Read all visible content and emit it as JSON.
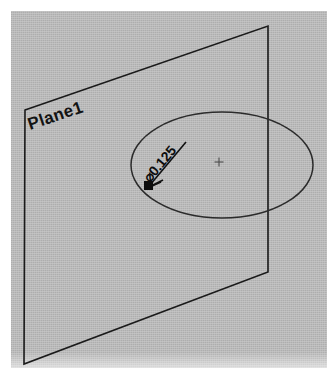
{
  "viewport": {
    "name": "cad-isometric-viewport",
    "background_color": "#b4b4b4",
    "page_color": "#ffffff"
  },
  "drawing": {
    "title": "",
    "type": "isometric-cad-sketch",
    "line_color": "#1a1a1a",
    "entities": {
      "plane": {
        "label": "Plane1",
        "label_rotation_deg": -18.5,
        "shape": "parallelogram",
        "corners": [
          {
            "name": "top-left",
            "x": 25,
            "y": 110
          },
          {
            "name": "top-right",
            "x": 268,
            "y": 26
          },
          {
            "name": "bottom-right",
            "x": 268,
            "y": 272
          },
          {
            "name": "bottom-left",
            "x": 24,
            "y": 364
          }
        ]
      },
      "circle_sketch": {
        "name": "circle",
        "projected_as": "ellipse",
        "center_x": 222,
        "center_y": 165,
        "radius_x": 91,
        "radius_y": 53,
        "stroke_color": "#2b2b2b"
      },
      "diameter_dimension": {
        "value_text": "⌀0.125",
        "diameter_symbol": "⌀",
        "numeric_value": "0.125",
        "text_rotation_deg": -50,
        "leader_start_x": 186,
        "leader_start_y": 142,
        "leader_end_x": 149,
        "leader_end_y": 186,
        "terminator": "filled-square",
        "color": "#0d0d0d"
      },
      "center_mark": {
        "name": "circle-center-mark",
        "x": 219,
        "y": 162,
        "size": 5,
        "color": "#4d4d4d"
      }
    }
  }
}
